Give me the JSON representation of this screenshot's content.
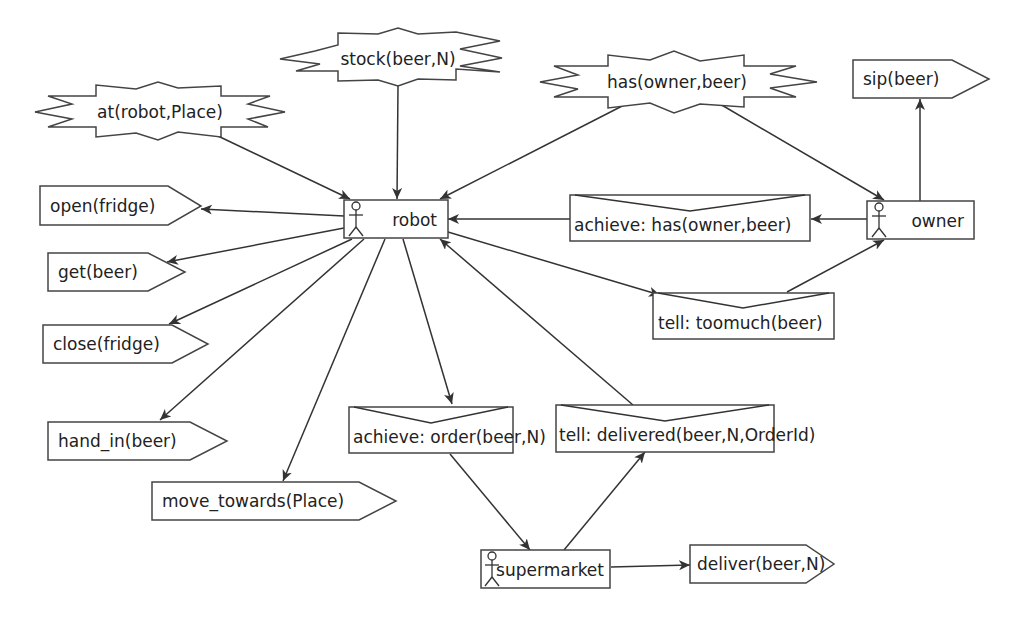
{
  "diagram": {
    "agents": [
      {
        "id": "robot",
        "label": "robot"
      },
      {
        "id": "owner",
        "label": "owner"
      },
      {
        "id": "supermarket",
        "label": "supermarket"
      }
    ],
    "percepts": [
      {
        "id": "stock",
        "label": "stock(beer,N)"
      },
      {
        "id": "at",
        "label": "at(robot,Place)"
      },
      {
        "id": "has",
        "label": "has(owner,beer)"
      }
    ],
    "actions": [
      {
        "id": "open",
        "label": "open(fridge)"
      },
      {
        "id": "get",
        "label": "get(beer)"
      },
      {
        "id": "close",
        "label": "close(fridge)"
      },
      {
        "id": "hand_in",
        "label": "hand_in(beer)"
      },
      {
        "id": "move_towards",
        "label": "move_towards(Place)"
      },
      {
        "id": "sip",
        "label": "sip(beer)"
      },
      {
        "id": "deliver",
        "label": "deliver(beer,N)"
      }
    ],
    "messages": [
      {
        "id": "achieve_has",
        "label": "achieve: has(owner,beer)"
      },
      {
        "id": "tell_toomuch",
        "label": "tell: toomuch(beer)"
      },
      {
        "id": "achieve_order",
        "label": "achieve: order(beer,N)"
      },
      {
        "id": "tell_delivered",
        "label": "tell: delivered(beer,N,OrderId)"
      }
    ],
    "edges": [
      {
        "from": "at(robot,Place)",
        "to": "robot"
      },
      {
        "from": "stock(beer,N)",
        "to": "robot"
      },
      {
        "from": "has(owner,beer)",
        "to": "robot"
      },
      {
        "from": "has(owner,beer)",
        "to": "owner"
      },
      {
        "from": "owner",
        "to": "sip(beer)"
      },
      {
        "from": "owner",
        "to": "achieve: has(owner,beer)"
      },
      {
        "from": "achieve: has(owner,beer)",
        "to": "robot"
      },
      {
        "from": "robot",
        "to": "open(fridge)"
      },
      {
        "from": "robot",
        "to": "get(beer)"
      },
      {
        "from": "robot",
        "to": "close(fridge)"
      },
      {
        "from": "robot",
        "to": "hand_in(beer)"
      },
      {
        "from": "robot",
        "to": "move_towards(Place)"
      },
      {
        "from": "robot",
        "to": "tell: toomuch(beer)"
      },
      {
        "from": "tell: toomuch(beer)",
        "to": "owner"
      },
      {
        "from": "robot",
        "to": "achieve: order(beer,N)"
      },
      {
        "from": "achieve: order(beer,N)",
        "to": "supermarket"
      },
      {
        "from": "supermarket",
        "to": "tell: delivered(beer,N,OrderId)"
      },
      {
        "from": "tell: delivered(beer,N,OrderId)",
        "to": "robot"
      },
      {
        "from": "supermarket",
        "to": "deliver(beer,N)"
      }
    ]
  }
}
